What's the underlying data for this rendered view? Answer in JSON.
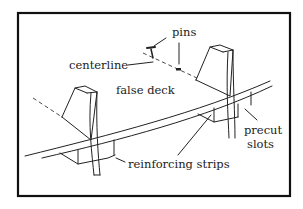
{
  "diagram": {
    "type": "labeled-illustration",
    "colors": {
      "line": "#222222",
      "frame": "#111111",
      "background": "#ffffff"
    },
    "labels": {
      "pins": "pins",
      "centerline": "centerline",
      "false_deck": "false deck",
      "precut": "precut",
      "slots": "slots",
      "reinforcing_strips": "reinforcing strips"
    },
    "parts": [
      "bulkhead-left",
      "bulkhead-right",
      "false-deck-strip",
      "reinforcing-strip-left",
      "reinforcing-strip-right",
      "pin-1",
      "pin-2",
      "centerline-dashed"
    ]
  }
}
